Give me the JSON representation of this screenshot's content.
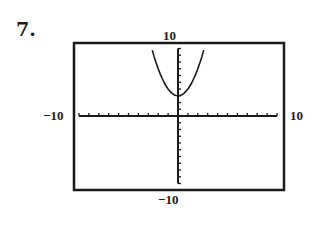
{
  "problem": {
    "number": "7."
  },
  "window": {
    "xmin_label": "−10",
    "xmax_label": "10",
    "ymin_label": "−10",
    "ymax_label": "10"
  },
  "colors": {
    "ink": "#1a1a1a",
    "background": "#ffffff"
  },
  "chart_data": {
    "type": "line",
    "title": "",
    "xlabel": "",
    "ylabel": "",
    "xlim": [
      -10,
      10
    ],
    "ylim": [
      -10,
      10
    ],
    "xscale_ticks": 1,
    "yscale_ticks": 1,
    "grid": false,
    "legend": null,
    "annotations": [
      "7.",
      "10",
      "−10",
      "−10",
      "10"
    ],
    "series": [
      {
        "name": "y = x^2 + 3",
        "x": [
          -2.6,
          -2.4,
          -2.2,
          -2.0,
          -1.8,
          -1.6,
          -1.4,
          -1.2,
          -1.0,
          -0.8,
          -0.6,
          -0.4,
          -0.2,
          0.0,
          0.2,
          0.4,
          0.6,
          0.8,
          1.0,
          1.2,
          1.4,
          1.6,
          1.8,
          2.0,
          2.2,
          2.4,
          2.6
        ],
        "y": [
          9.76,
          8.76,
          7.84,
          7.0,
          6.24,
          5.56,
          4.96,
          4.44,
          4.0,
          3.64,
          3.36,
          3.16,
          3.04,
          3.0,
          3.04,
          3.16,
          3.36,
          3.64,
          4.0,
          4.44,
          4.96,
          5.56,
          6.24,
          7.0,
          7.84,
          8.76,
          9.76
        ]
      }
    ]
  }
}
